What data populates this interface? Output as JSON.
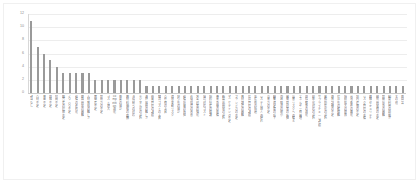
{
  "chart_data": {
    "type": "bar",
    "title": "",
    "subtitle": "",
    "xlabel": "",
    "ylabel": "",
    "ylim": [
      0,
      12
    ],
    "grid": true,
    "legend": "none",
    "orientation": "vertical",
    "bar_color": "#9a9a9a",
    "gridline_color": "#ededed",
    "axis_color": "#c9c9c9",
    "label_color": "#8a8a8a",
    "y_ticks": [
      12,
      10,
      8,
      6,
      4,
      2,
      0
    ],
    "y_tick_labels": [
      "12",
      "10",
      "8",
      "6",
      "4",
      "2",
      "0"
    ],
    "categories": [
      "該当なし",
      "人材不足",
      "資金不足",
      "情報不足",
      "時間不足",
      "経営者の理解不足",
      "ノウハウ不足",
      "設備の老朽化",
      "販路開拓の困難",
      "人材育成の難しさ",
      "後継者不足",
      "技術力の不足",
      "コスト増大",
      "competition激化",
      "需要の減少",
      "原材料価格の高騰",
      "法規制への対応",
      "デジタル化の遅れ",
      "海外展開の難しさ",
      "品質管理の課題",
      "物流コストの上昇",
      "人件費の上昇",
      "為替変動リスク",
      "取引先の減少",
      "設備投資の負担",
      "労働環境の改善",
      "安全対策の強化",
      "環境対応コスト",
      "知的財産の保護",
      "事業承継の準備",
      "新製品開発の遅れ",
      "マーケティング不足",
      "ブランド力の不足",
      "資材調達の困難",
      "在庫管理の課題",
      "生産性の低迷",
      "システム導入の遅れ",
      "営業力の不足",
      "顧客満足度の低下",
      "地域経済の縮小",
      "感染症対策の負担",
      "災害リスクへの備え",
      "エネルギー費用増",
      "国際競争の激化",
      "標準化対応の遅れ",
      "サプライチェーン課題",
      "業務効率化の遅れ",
      "教育訓練の不足",
      "外注先の確保難",
      "規模拡大の限界",
      "立地条件の悪化",
      "社内連携の不足",
      "リスク管理の不備",
      "情報セキュリティ",
      "研究開発費の不足",
      "技能伝承の困難",
      "制度利用の煩雑さ",
      "その他",
      "無回答"
    ],
    "values": [
      11,
      7,
      6,
      5,
      4,
      3,
      3,
      3,
      3,
      3,
      2,
      2,
      2,
      2,
      2,
      2,
      2,
      2,
      1,
      1,
      1,
      1,
      1,
      1,
      1,
      1,
      1,
      1,
      1,
      1,
      1,
      1,
      1,
      1,
      1,
      1,
      1,
      1,
      1,
      1,
      1,
      1,
      1,
      1,
      1,
      1,
      1,
      1,
      1,
      1,
      1,
      1,
      1,
      1,
      1,
      1,
      1,
      1,
      1
    ]
  }
}
